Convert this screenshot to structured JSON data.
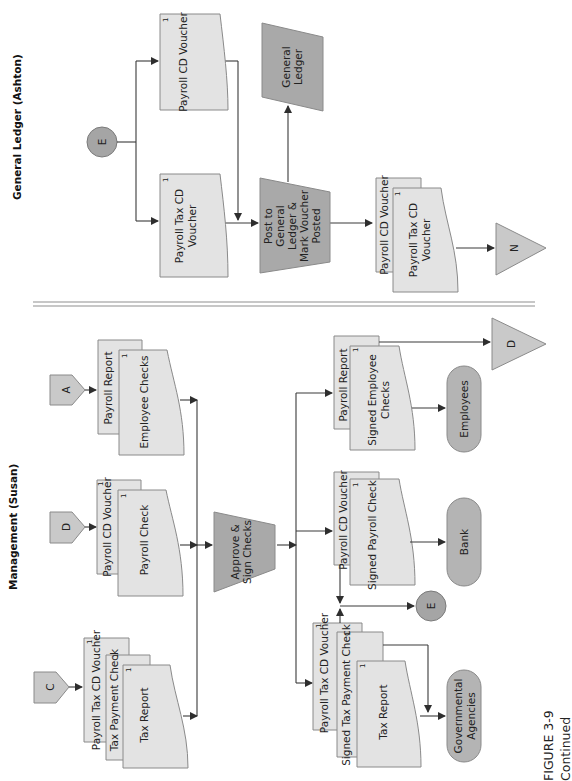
{
  "figure": {
    "label": "FIGURE 3-9",
    "caption": "Continued"
  },
  "lanes": {
    "general_ledger": "General Ledger (Ashton)",
    "management": "Management (Susan)"
  },
  "general_ledger": {
    "connector_in": "E",
    "doc_payroll_tax_cd_voucher": {
      "line1": "Payroll Tax CD",
      "line2": "Voucher",
      "copy": "1"
    },
    "doc_payroll_cd_voucher": {
      "label": "Payroll CD Voucher",
      "copy": "1"
    },
    "process_post": {
      "line1": "Post to",
      "line2": "General",
      "line3": "Ledger &",
      "line4": "Mark Voucher",
      "line5": "Posted"
    },
    "ledger": {
      "line1": "General",
      "line2": "Ledger"
    },
    "output_stack": {
      "back": {
        "label": "Payroll CD Voucher",
        "copy": "1"
      },
      "front": {
        "line1": "Payroll Tax CD",
        "line2": "Voucher",
        "copy": "1"
      }
    },
    "file_connector": "N"
  },
  "management": {
    "connector_c": "C",
    "connector_d_in": "D",
    "connector_a": "A",
    "input_tax_stack": {
      "back": {
        "label": "Payroll Tax CD Voucher",
        "copy": "1"
      },
      "middle": {
        "label": "Tax Payment Check",
        "copy": "1"
      },
      "front": {
        "label": "Tax Report",
        "copy": "1"
      }
    },
    "input_payroll_stack": {
      "back": {
        "label": "Payroll CD Voucher",
        "copy": "1"
      },
      "front": {
        "label": "Payroll Check",
        "copy": "1"
      }
    },
    "input_employee_stack": {
      "back": {
        "label": "Payroll Report"
      },
      "front": {
        "label": "Employee Checks",
        "copy": "1"
      }
    },
    "process_approve": {
      "line1": "Approve &",
      "line2": "Sign Checks"
    },
    "output_tax_stack": {
      "back": {
        "label": "Payroll Tax CD Voucher",
        "copy": "1"
      },
      "middle": {
        "label": "Signed Tax Payment Check",
        "copy": "1"
      },
      "front": {
        "label": "Tax Report",
        "copy": "1"
      }
    },
    "output_payroll_stack": {
      "back": {
        "label": "Payroll CD Voucher",
        "copy": "1"
      },
      "front": {
        "label": "Signed Payroll Check",
        "copy": "1"
      }
    },
    "output_employee_stack": {
      "back": {
        "label": "Payroll Report"
      },
      "front": {
        "line1": "Signed Employee",
        "line2": "Checks",
        "copy": "1"
      }
    },
    "terminal_gov": {
      "line1": "Governmental",
      "line2": "Agencies"
    },
    "terminal_bank": "Bank",
    "terminal_employees": "Employees",
    "connector_e_out": "E",
    "file_connector_d": "D"
  },
  "colors": {
    "document_fill": "#e3e3e3",
    "process_fill": "#a9a9a9",
    "terminal_fill": "#b4b4b4",
    "connector_fill": "#c9c9c9",
    "line": "#3a3a3a"
  }
}
